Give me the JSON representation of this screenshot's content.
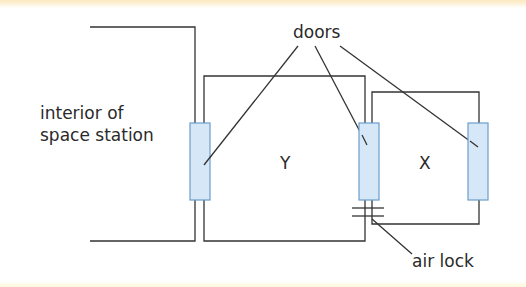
{
  "diagram": {
    "labels": {
      "doors": "doors",
      "interior_line1": "interior of",
      "interior_line2": "space station",
      "chamber_y": "Y",
      "chamber_x": "X",
      "air_lock": "air lock"
    },
    "colors": {
      "line": "#333333",
      "door_fill": "#d6e8f7",
      "door_stroke": "#6a9dcc",
      "top_band": "#fbe9bf"
    }
  }
}
